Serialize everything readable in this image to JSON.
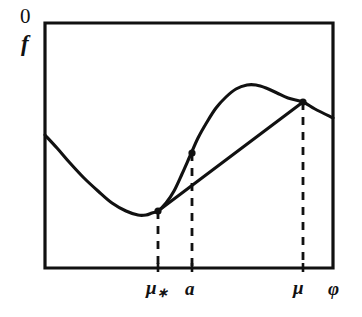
{
  "figure": {
    "kind": "line",
    "background_color": "#ffffff",
    "ink_color": "#111111",
    "frame": {
      "x0": 45,
      "y0": 23,
      "x1": 333,
      "y1": 268
    },
    "axis_labels": {
      "origin_label": "0",
      "y_axis_label": "f",
      "x_axis_label": "φ"
    },
    "x_tick_labels": [
      {
        "name": "mu-star",
        "text_main": "μ",
        "text_sub": "∗",
        "x": 158
      },
      {
        "name": "a",
        "text_main": "a",
        "text_sub": "",
        "x": 192
      },
      {
        "name": "mu",
        "text_main": "μ",
        "text_sub": "",
        "x": 303
      }
    ],
    "curve": {
      "name": "objective-function-curve",
      "description": "f as a function of phi: decreasing to a minimum, then rising to a maximum, then decreasing",
      "points": [
        [
          45,
          135
        ],
        [
          57,
          148
        ],
        [
          70,
          163
        ],
        [
          84,
          178
        ],
        [
          98,
          191
        ],
        [
          112,
          203
        ],
        [
          126,
          211
        ],
        [
          138,
          215
        ],
        [
          146,
          215
        ],
        [
          152,
          213
        ],
        [
          158,
          211
        ],
        [
          166,
          203
        ],
        [
          174,
          191
        ],
        [
          182,
          174
        ],
        [
          190,
          156
        ],
        [
          198,
          138
        ],
        [
          207,
          122
        ],
        [
          216,
          108
        ],
        [
          226,
          97
        ],
        [
          236,
          89
        ],
        [
          247,
          85
        ],
        [
          256,
          85
        ],
        [
          266,
          88
        ],
        [
          277,
          93
        ],
        [
          288,
          98
        ],
        [
          303,
          102
        ],
        [
          315,
          109
        ],
        [
          333,
          118
        ]
      ]
    },
    "chord": {
      "name": "secant-line",
      "description": "straight line joining the point at mu-star on the curve to the point at mu on the curve",
      "x1": 158,
      "y1": 211,
      "x2": 303,
      "y2": 102
    },
    "markers": [
      {
        "name": "marker-mu-star",
        "x": 158,
        "y": 211
      },
      {
        "name": "marker-a",
        "x": 192,
        "y": 153
      },
      {
        "name": "marker-mu",
        "x": 303,
        "y": 102
      }
    ],
    "dashed_drop_lines": [
      {
        "name": "drop-line-mu-star",
        "x": 158,
        "y_top": 211,
        "y_bottom": 268
      },
      {
        "name": "drop-line-a",
        "x": 192,
        "y_top": 153,
        "y_bottom": 268
      },
      {
        "name": "drop-line-mu",
        "x": 303,
        "y_top": 102,
        "y_bottom": 268
      }
    ],
    "axis_ticks": [
      {
        "name": "tick-mu-star",
        "x": 158
      },
      {
        "name": "tick-a",
        "x": 192
      },
      {
        "name": "tick-mu",
        "x": 303
      }
    ]
  },
  "chart_data": {
    "type": "line",
    "title": "",
    "xlabel": "φ",
    "ylabel": "f",
    "grid": false,
    "legend": "none",
    "xlim": [
      45,
      333
    ],
    "ylim": [
      268,
      23
    ],
    "annotations": [
      "0 marks the origin corner at the top-left of the frame",
      "vertical dashed lines mark phi = mu-star, phi = a and phi = mu",
      "the straight secant segment connects the curve point at mu-star to the curve point at mu",
      "the marked point above a lies on the curve, above the secant line"
    ],
    "series": [
      {
        "name": "f(phi)",
        "x": [
          45,
          57,
          70,
          84,
          98,
          112,
          126,
          138,
          146,
          152,
          158,
          166,
          174,
          182,
          190,
          198,
          207,
          216,
          226,
          236,
          247,
          256,
          266,
          277,
          288,
          303,
          315,
          333
        ],
        "values": [
          135,
          148,
          163,
          178,
          191,
          203,
          211,
          215,
          215,
          213,
          211,
          203,
          191,
          174,
          156,
          138,
          122,
          108,
          97,
          89,
          85,
          85,
          88,
          93,
          98,
          102,
          109,
          118
        ]
      },
      {
        "name": "secant",
        "x": [
          158,
          303
        ],
        "values": [
          211,
          102
        ]
      }
    ]
  }
}
